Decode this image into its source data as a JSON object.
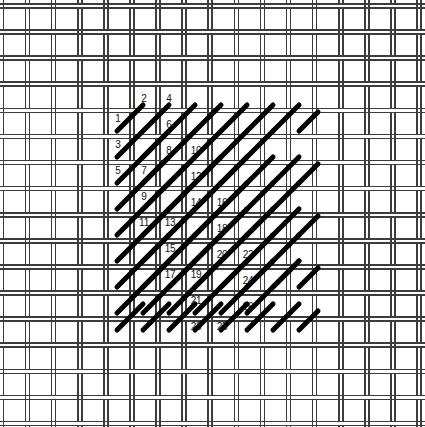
{
  "figure": {
    "type": "needlework-stitch-diagram",
    "width": 425,
    "height": 427,
    "background_color": "#ffffff"
  },
  "canvas_mesh": {
    "name": "woven-canvas-grid",
    "line_color": "#3c3c3c",
    "line_width": 1.6,
    "pair_gap": 4,
    "cell_pitch": 26.1,
    "x_origin": 25.5,
    "y_origin": 30.0,
    "columns": 16,
    "rows": 16,
    "description": "double-thread canvas, vertical and horizontal thread pairs woven over-under"
  },
  "stitches": {
    "name": "diagonal-stitches",
    "color": "#000000",
    "stroke_width": 5,
    "angle_degrees": 45,
    "direction": "lower-left to upper-right",
    "span_cells": 2,
    "count": 62,
    "list": [
      {
        "x1": 117,
        "y1": 131,
        "x2": 143,
        "y2": 105
      },
      {
        "x1": 117,
        "y1": 157,
        "x2": 169,
        "y2": 105
      },
      {
        "x1": 117,
        "y1": 183,
        "x2": 169,
        "y2": 131
      },
      {
        "x1": 117,
        "y1": 209,
        "x2": 169,
        "y2": 157
      },
      {
        "x1": 117,
        "y1": 235,
        "x2": 169,
        "y2": 183
      },
      {
        "x1": 117,
        "y1": 261,
        "x2": 169,
        "y2": 209
      },
      {
        "x1": 117,
        "y1": 287,
        "x2": 169,
        "y2": 235
      },
      {
        "x1": 117,
        "y1": 313,
        "x2": 169,
        "y2": 261
      },
      {
        "x1": 117,
        "y1": 330,
        "x2": 143,
        "y2": 304
      },
      {
        "x1": 143,
        "y1": 157,
        "x2": 195,
        "y2": 105
      },
      {
        "x1": 143,
        "y1": 183,
        "x2": 195,
        "y2": 131
      },
      {
        "x1": 143,
        "y1": 209,
        "x2": 195,
        "y2": 157
      },
      {
        "x1": 143,
        "y1": 235,
        "x2": 195,
        "y2": 183
      },
      {
        "x1": 143,
        "y1": 261,
        "x2": 195,
        "y2": 209
      },
      {
        "x1": 143,
        "y1": 287,
        "x2": 195,
        "y2": 235
      },
      {
        "x1": 143,
        "y1": 313,
        "x2": 195,
        "y2": 261
      },
      {
        "x1": 143,
        "y1": 330,
        "x2": 169,
        "y2": 304
      },
      {
        "x1": 169,
        "y1": 183,
        "x2": 221,
        "y2": 131
      },
      {
        "x1": 169,
        "y1": 209,
        "x2": 221,
        "y2": 157
      },
      {
        "x1": 169,
        "y1": 235,
        "x2": 221,
        "y2": 183
      },
      {
        "x1": 169,
        "y1": 261,
        "x2": 221,
        "y2": 209
      },
      {
        "x1": 169,
        "y1": 287,
        "x2": 221,
        "y2": 235
      },
      {
        "x1": 169,
        "y1": 313,
        "x2": 221,
        "y2": 261
      },
      {
        "x1": 169,
        "y1": 330,
        "x2": 195,
        "y2": 304
      },
      {
        "x1": 195,
        "y1": 131,
        "x2": 221,
        "y2": 105
      },
      {
        "x1": 195,
        "y1": 209,
        "x2": 247,
        "y2": 157
      },
      {
        "x1": 195,
        "y1": 235,
        "x2": 247,
        "y2": 183
      },
      {
        "x1": 195,
        "y1": 261,
        "x2": 247,
        "y2": 209
      },
      {
        "x1": 195,
        "y1": 287,
        "x2": 247,
        "y2": 235
      },
      {
        "x1": 195,
        "y1": 313,
        "x2": 247,
        "y2": 261
      },
      {
        "x1": 195,
        "y1": 330,
        "x2": 221,
        "y2": 304
      },
      {
        "x1": 221,
        "y1": 131,
        "x2": 247,
        "y2": 105
      },
      {
        "x1": 221,
        "y1": 183,
        "x2": 247,
        "y2": 157
      },
      {
        "x1": 221,
        "y1": 261,
        "x2": 273,
        "y2": 209
      },
      {
        "x1": 221,
        "y1": 287,
        "x2": 273,
        "y2": 235
      },
      {
        "x1": 221,
        "y1": 313,
        "x2": 273,
        "y2": 261
      },
      {
        "x1": 221,
        "y1": 330,
        "x2": 247,
        "y2": 304
      },
      {
        "x1": 247,
        "y1": 131,
        "x2": 273,
        "y2": 105
      },
      {
        "x1": 247,
        "y1": 183,
        "x2": 273,
        "y2": 157
      },
      {
        "x1": 247,
        "y1": 235,
        "x2": 273,
        "y2": 209
      },
      {
        "x1": 247,
        "y1": 313,
        "x2": 299,
        "y2": 261
      },
      {
        "x1": 247,
        "y1": 330,
        "x2": 273,
        "y2": 304
      },
      {
        "x1": 273,
        "y1": 131,
        "x2": 299,
        "y2": 105
      },
      {
        "x1": 273,
        "y1": 183,
        "x2": 299,
        "y2": 157
      },
      {
        "x1": 273,
        "y1": 235,
        "x2": 299,
        "y2": 209
      },
      {
        "x1": 273,
        "y1": 287,
        "x2": 299,
        "y2": 261
      },
      {
        "x1": 273,
        "y1": 330,
        "x2": 299,
        "y2": 304
      },
      {
        "x1": 299,
        "y1": 131,
        "x2": 318,
        "y2": 112
      },
      {
        "x1": 299,
        "y1": 183,
        "x2": 318,
        "y2": 164
      },
      {
        "x1": 299,
        "y1": 235,
        "x2": 318,
        "y2": 216
      },
      {
        "x1": 299,
        "y1": 287,
        "x2": 318,
        "y2": 268
      },
      {
        "x1": 299,
        "y1": 330,
        "x2": 318,
        "y2": 311
      },
      {
        "x1": 221,
        "y1": 235,
        "x2": 247,
        "y2": 209
      },
      {
        "x1": 247,
        "y1": 287,
        "x2": 273,
        "y2": 261
      },
      {
        "x1": 195,
        "y1": 183,
        "x2": 221,
        "y2": 157
      },
      {
        "x1": 221,
        "y1": 209,
        "x2": 247,
        "y2": 183
      },
      {
        "x1": 247,
        "y1": 209,
        "x2": 273,
        "y2": 183
      },
      {
        "x1": 273,
        "y1": 209,
        "x2": 299,
        "y2": 183
      },
      {
        "x1": 273,
        "y1": 261,
        "x2": 299,
        "y2": 235
      },
      {
        "x1": 247,
        "y1": 261,
        "x2": 273,
        "y2": 235
      },
      {
        "x1": 221,
        "y1": 157,
        "x2": 247,
        "y2": 131
      },
      {
        "x1": 247,
        "y1": 157,
        "x2": 273,
        "y2": 131
      }
    ]
  },
  "numbers": {
    "name": "stitch-sequence-numbers",
    "color": "#111111",
    "font_size_px": 10,
    "sequence_min": 1,
    "sequence_max": 26,
    "list": [
      {
        "label": "1",
        "x": 118,
        "y": 119
      },
      {
        "label": "2",
        "x": 144,
        "y": 99
      },
      {
        "label": "3",
        "x": 118,
        "y": 145
      },
      {
        "label": "4",
        "x": 169,
        "y": 99
      },
      {
        "label": "5",
        "x": 118,
        "y": 171
      },
      {
        "label": "6",
        "x": 169,
        "y": 125
      },
      {
        "label": "7",
        "x": 144,
        "y": 171
      },
      {
        "label": "8",
        "x": 169,
        "y": 151
      },
      {
        "label": "9",
        "x": 144,
        "y": 197
      },
      {
        "label": "10",
        "x": 196,
        "y": 151
      },
      {
        "label": "11",
        "x": 144,
        "y": 223
      },
      {
        "label": "12",
        "x": 196,
        "y": 177
      },
      {
        "label": "13",
        "x": 170,
        "y": 223
      },
      {
        "label": "14",
        "x": 196,
        "y": 203
      },
      {
        "label": "15",
        "x": 170,
        "y": 249
      },
      {
        "label": "16",
        "x": 222,
        "y": 203
      },
      {
        "label": "17",
        "x": 170,
        "y": 275
      },
      {
        "label": "18",
        "x": 222,
        "y": 229
      },
      {
        "label": "19",
        "x": 196,
        "y": 275
      },
      {
        "label": "20",
        "x": 222,
        "y": 255
      },
      {
        "label": "21",
        "x": 196,
        "y": 301
      },
      {
        "label": "22",
        "x": 248,
        "y": 255
      },
      {
        "label": "23",
        "x": 196,
        "y": 327
      },
      {
        "label": "24",
        "x": 248,
        "y": 281
      },
      {
        "label": "25",
        "x": 222,
        "y": 327
      },
      {
        "label": "26",
        "x": 248,
        "y": 307
      }
    ]
  }
}
